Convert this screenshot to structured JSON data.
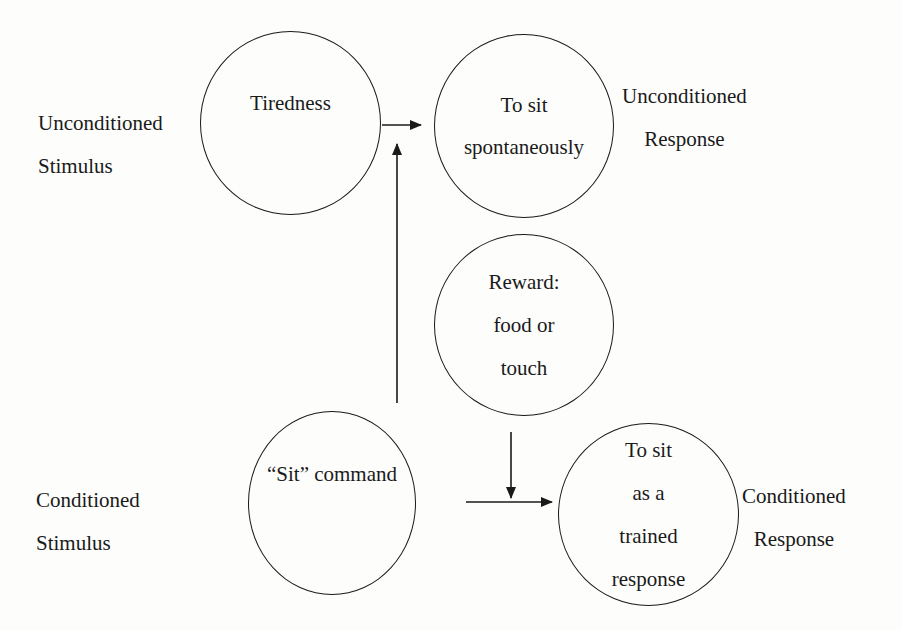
{
  "diagram": {
    "type": "classical-conditioning",
    "labels": {
      "unconditioned_stimulus": [
        "Unconditioned",
        "Stimulus"
      ],
      "unconditioned_response": [
        "Unconditioned",
        "Response"
      ],
      "conditioned_stimulus": [
        "Conditioned",
        "Stimulus"
      ],
      "conditioned_response": [
        "Conditioned",
        "Response"
      ]
    },
    "nodes": {
      "tiredness": [
        "Tiredness"
      ],
      "sit_spontaneously": [
        "To sit",
        "spontaneously"
      ],
      "reward": [
        "Reward:",
        "food or",
        "touch"
      ],
      "sit_command": [
        "“Sit” command"
      ],
      "sit_trained": [
        "To sit",
        "as a",
        "trained",
        "response"
      ]
    },
    "edges": [
      {
        "from": "tiredness",
        "to": "sit_spontaneously"
      },
      {
        "from": "sit_command",
        "to": "sit_spontaneously"
      },
      {
        "from": "sit_command",
        "to": "sit_trained"
      },
      {
        "from": "reward",
        "to": "sit_trained"
      }
    ]
  }
}
